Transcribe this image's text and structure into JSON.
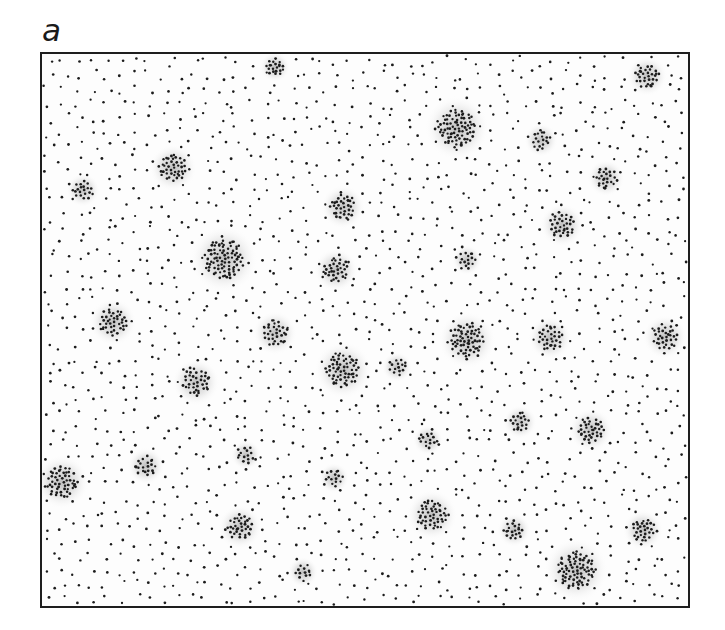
{
  "figure": {
    "panel_label": "a",
    "frame": {
      "x": 40,
      "y": 52,
      "width": 648,
      "height": 554
    },
    "colors": {
      "dot": "#1c1c1c",
      "halo": "#9a9a9a",
      "frame": "#1e1e1e",
      "background": "#ffffff"
    },
    "background_dots": {
      "count": 1750,
      "radius": 1.1
    },
    "clusters": [
      {
        "x": 275,
        "y": 67,
        "r": 9,
        "n": 18,
        "size": "small"
      },
      {
        "x": 173,
        "y": 168,
        "r": 14,
        "n": 40,
        "size": "medium"
      },
      {
        "x": 83,
        "y": 190,
        "r": 10,
        "n": 18,
        "size": "small"
      },
      {
        "x": 343,
        "y": 207,
        "r": 13,
        "n": 32,
        "size": "medium"
      },
      {
        "x": 224,
        "y": 259,
        "r": 20,
        "n": 80,
        "size": "large"
      },
      {
        "x": 336,
        "y": 270,
        "r": 13,
        "n": 32,
        "size": "medium"
      },
      {
        "x": 647,
        "y": 76,
        "r": 12,
        "n": 28,
        "size": "medium"
      },
      {
        "x": 457,
        "y": 128,
        "r": 19,
        "n": 75,
        "size": "large"
      },
      {
        "x": 541,
        "y": 140,
        "r": 10,
        "n": 16,
        "size": "small"
      },
      {
        "x": 606,
        "y": 178,
        "r": 11,
        "n": 22,
        "size": "small"
      },
      {
        "x": 562,
        "y": 225,
        "r": 13,
        "n": 30,
        "size": "medium"
      },
      {
        "x": 467,
        "y": 260,
        "r": 9,
        "n": 14,
        "size": "small"
      },
      {
        "x": 113,
        "y": 322,
        "r": 14,
        "n": 36,
        "size": "medium"
      },
      {
        "x": 275,
        "y": 333,
        "r": 13,
        "n": 30,
        "size": "medium"
      },
      {
        "x": 196,
        "y": 382,
        "r": 14,
        "n": 34,
        "size": "medium"
      },
      {
        "x": 343,
        "y": 370,
        "r": 17,
        "n": 55,
        "size": "large"
      },
      {
        "x": 467,
        "y": 340,
        "r": 17,
        "n": 58,
        "size": "large"
      },
      {
        "x": 550,
        "y": 338,
        "r": 13,
        "n": 30,
        "size": "medium"
      },
      {
        "x": 665,
        "y": 337,
        "r": 13,
        "n": 30,
        "size": "medium"
      },
      {
        "x": 397,
        "y": 367,
        "r": 9,
        "n": 14,
        "size": "small"
      },
      {
        "x": 520,
        "y": 422,
        "r": 10,
        "n": 18,
        "size": "small"
      },
      {
        "x": 591,
        "y": 430,
        "r": 13,
        "n": 34,
        "size": "medium"
      },
      {
        "x": 428,
        "y": 440,
        "r": 9,
        "n": 14,
        "size": "small"
      },
      {
        "x": 62,
        "y": 482,
        "r": 16,
        "n": 50,
        "size": "large"
      },
      {
        "x": 146,
        "y": 466,
        "r": 11,
        "n": 18,
        "size": "small"
      },
      {
        "x": 246,
        "y": 455,
        "r": 9,
        "n": 13,
        "size": "small"
      },
      {
        "x": 240,
        "y": 527,
        "r": 13,
        "n": 32,
        "size": "medium"
      },
      {
        "x": 334,
        "y": 478,
        "r": 9,
        "n": 14,
        "size": "small"
      },
      {
        "x": 303,
        "y": 572,
        "r": 9,
        "n": 12,
        "size": "small"
      },
      {
        "x": 432,
        "y": 515,
        "r": 15,
        "n": 44,
        "size": "medium"
      },
      {
        "x": 514,
        "y": 530,
        "r": 10,
        "n": 18,
        "size": "small"
      },
      {
        "x": 643,
        "y": 530,
        "r": 12,
        "n": 28,
        "size": "medium"
      },
      {
        "x": 576,
        "y": 570,
        "r": 19,
        "n": 75,
        "size": "large"
      }
    ]
  }
}
